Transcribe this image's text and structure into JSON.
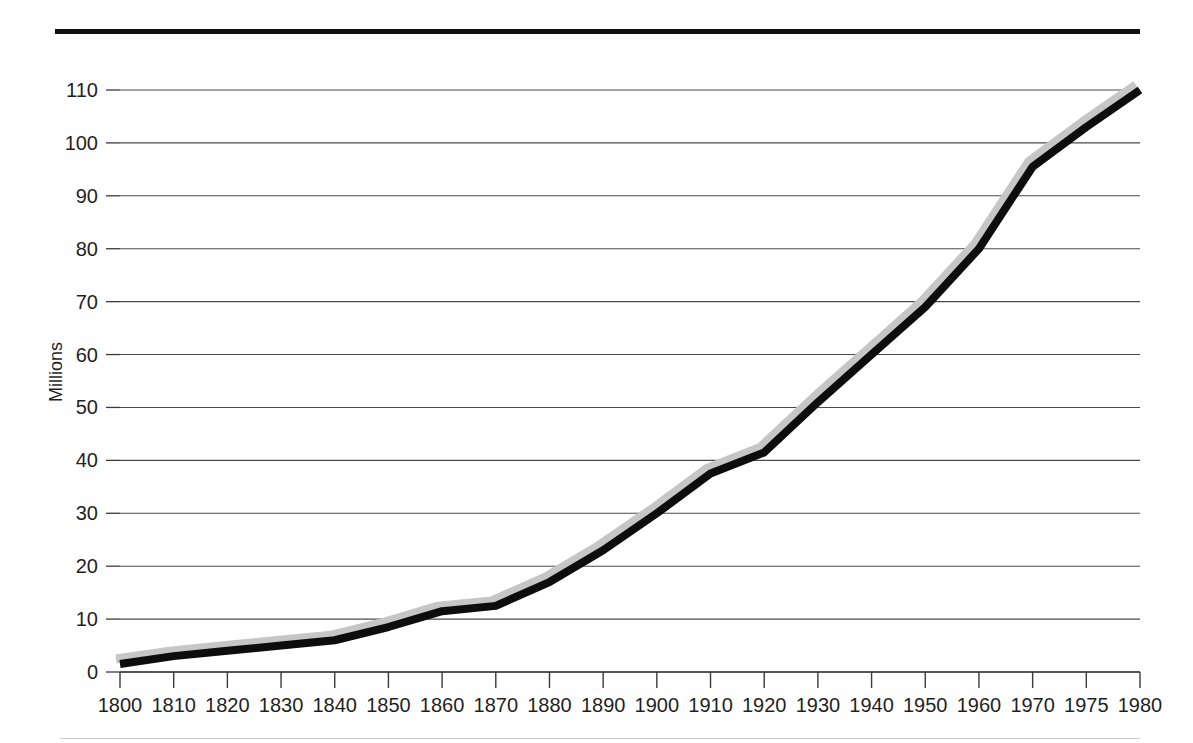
{
  "figure": {
    "top_rule": "top-rule",
    "bottom_rule": "bottom-rule"
  },
  "chart_data": {
    "type": "line",
    "title": "",
    "subtitle": "",
    "xlabel": "",
    "ylabel": "Millions",
    "categories": [
      "1800",
      "1810",
      "1820",
      "1830",
      "1840",
      "1850",
      "1860",
      "1870",
      "1880",
      "1890",
      "1900",
      "1910",
      "1920",
      "1930",
      "1940",
      "1950",
      "1960",
      "1970",
      "1975",
      "1980"
    ],
    "values": [
      1.5,
      3.0,
      4.0,
      5.0,
      6.0,
      8.5,
      11.5,
      12.5,
      17.0,
      23.0,
      30.0,
      37.5,
      41.5,
      51.0,
      60.0,
      69.0,
      80.0,
      95.5,
      103.0,
      110.0
    ],
    "series": [
      {
        "name": "Population",
        "values": [
          1.5,
          3.0,
          4.0,
          5.0,
          6.0,
          8.5,
          11.5,
          12.5,
          17.0,
          23.0,
          30.0,
          37.5,
          41.5,
          51.0,
          60.0,
          69.0,
          80.0,
          95.5,
          103.0,
          110.0
        ]
      }
    ],
    "yticks": [
      0,
      10,
      20,
      30,
      40,
      50,
      60,
      70,
      80,
      90,
      100,
      110
    ],
    "ytick_labels": [
      "0",
      "10",
      "20",
      "30",
      "40",
      "50",
      "60",
      "70",
      "80",
      "90",
      "100",
      "110"
    ],
    "ylim": [
      0,
      110
    ],
    "grid": true,
    "grid_axis": "y",
    "legend": false,
    "legend_position": "none",
    "line_color": "#0d0d0d",
    "shadow_color": "#c6c6c6",
    "grid_color": "#4a4a4a",
    "axis_color": "#3a3a3a",
    "background": "#ffffff",
    "x_axis_note": "categorical spacing: equal width per tick, final interval 1975-1980 spans 5 years"
  }
}
